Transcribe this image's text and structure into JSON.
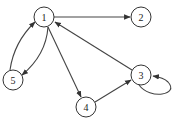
{
  "graph": {
    "type": "directed",
    "node_radius": 10,
    "colors": {
      "stroke": "#333333",
      "edge": "#444444",
      "background": "#ffffff",
      "fill": "#ffffff"
    },
    "nodes": [
      {
        "id": "1",
        "label": "1",
        "x": 44,
        "y": 17
      },
      {
        "id": "2",
        "label": "2",
        "x": 141,
        "y": 17
      },
      {
        "id": "3",
        "label": "3",
        "x": 141,
        "y": 75
      },
      {
        "id": "4",
        "label": "4",
        "x": 86,
        "y": 107
      },
      {
        "id": "5",
        "label": "5",
        "x": 13,
        "y": 80
      }
    ],
    "edges": [
      {
        "from": "1",
        "to": "2"
      },
      {
        "from": "1",
        "to": "5"
      },
      {
        "from": "5",
        "to": "1"
      },
      {
        "from": "1",
        "to": "4"
      },
      {
        "from": "4",
        "to": "3"
      },
      {
        "from": "3",
        "to": "1"
      },
      {
        "from": "3",
        "to": "3"
      }
    ]
  }
}
